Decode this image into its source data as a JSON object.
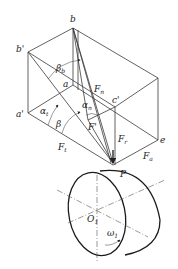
{
  "figure": {
    "labels": {
      "b": "b",
      "b_prime": "b'",
      "a": "a",
      "a_prime": "a'",
      "c_prime": "c'",
      "e": "e",
      "P": "P",
      "beta_b": "β",
      "beta_b_sub": "b",
      "beta": "β",
      "alpha_t": "α",
      "alpha_t_sub": "t",
      "alpha_n": "α",
      "alpha_n_sub": "n",
      "F_n": "F",
      "F_n_sub": "n",
      "F_prime": "F'",
      "F_t": "F",
      "F_t_sub": "t",
      "F_r": "F",
      "F_r_sub": "r",
      "F_a": "F",
      "F_a_sub": "a",
      "O1": "O",
      "O1_sub": "1",
      "omega1": "ω",
      "omega1_sub": "1"
    }
  }
}
